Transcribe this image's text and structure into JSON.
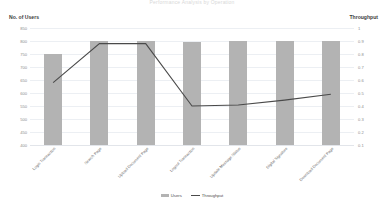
{
  "chart_data": {
    "type": "bar",
    "title": "Performance Analysis by Operation",
    "categories": [
      "Login Transaction",
      "Search Page",
      "Upload Document Page",
      "Logout Transaction",
      "Update Message Status",
      "Digital Signature",
      "Download Document Page"
    ],
    "series": [
      {
        "name": "Users",
        "type": "bar",
        "axis": "left",
        "values": [
          750,
          800,
          800,
          795,
          800,
          800,
          800
        ]
      },
      {
        "name": "Throughput",
        "type": "line",
        "axis": "right",
        "values": [
          0.72,
          0.92,
          0.92,
          0.6,
          0.605,
          0.63,
          0.66
        ]
      }
    ],
    "xlabel": "",
    "ylabel": "No. of Users",
    "y2label": "Throughput",
    "ylim": [
      400,
      850
    ],
    "y2lim": [
      0.4,
      1.0
    ],
    "yticks": [
      850,
      800,
      750,
      700,
      650,
      600,
      550,
      500,
      450,
      400
    ],
    "y2ticks": [
      "1",
      "0.9",
      "0.8",
      "0.7",
      "0.6",
      "0.5",
      "0.4",
      "0.3",
      "0.2",
      "0.1"
    ],
    "grid": true,
    "legend_position": "bottom"
  },
  "axes": {
    "left_title": "No. of Users",
    "right_title": "Throughput"
  },
  "legend": {
    "items": [
      {
        "label": "Users",
        "marker": "bar-swatch",
        "color": "#b3b3b3"
      },
      {
        "label": "Throughput",
        "marker": "line-swatch",
        "color": "#4a4a4a"
      }
    ]
  },
  "colors": {
    "bar": "#b3b3b3",
    "line": "#4a4a4a",
    "gridline": "#eceff3",
    "tick_text": "#8d8d8d",
    "axis_title": "#3b3b3b"
  }
}
